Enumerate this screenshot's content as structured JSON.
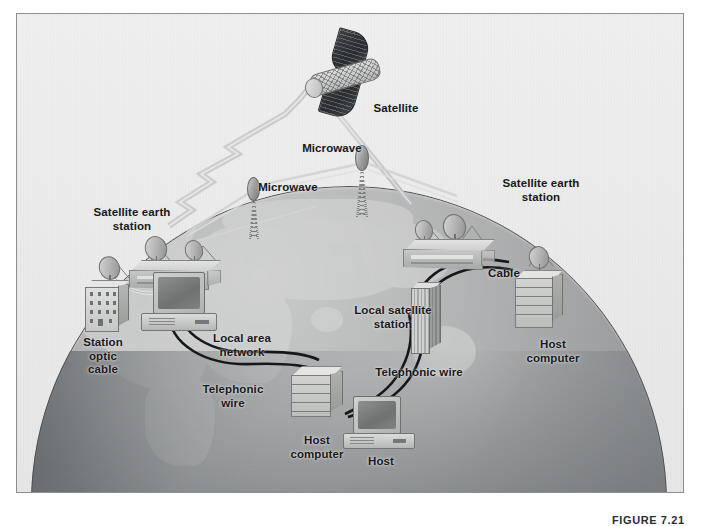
{
  "figure": {
    "caption": "FIGURE 7.21",
    "border_color": "#8d8d8d",
    "sky_color": "#ececed",
    "globe_land_color": "#c3c5c4",
    "globe_ocean_color": "#a9abac",
    "globe_deep_ocean_color": "#686c6f",
    "label_color": "#17181a"
  },
  "labels": {
    "satellite": "Satellite",
    "microwave_left": "Microwave",
    "microwave_right": "Microwave",
    "satellite_earth_station_left": "Satellite earth\nstation",
    "satellite_earth_station_right": "Satellite earth\nstation",
    "station_optic_cable": "Station\noptic\ncable",
    "local_area_network": "Local area\nnetwork",
    "telephonic_wire_left": "Telephonic\nwire",
    "host_computer_left": "Host\ncomputer",
    "local_satellite_station": "Local satellite\nstation",
    "telephonic_wire_right": "Telephonic wire",
    "host": "Host",
    "cable": "Cable",
    "host_computer_right": "Host\ncomputer"
  },
  "icons": {
    "satellite": "satellite-icon",
    "dish": "satellite-dish-icon",
    "microwave_tower": "microwave-tower-icon",
    "monitor": "crt-computer-icon",
    "server": "server-rack-icon",
    "office": "office-building-icon",
    "skyscraper": "skyscraper-icon",
    "earth_station_building": "earth-station-building-icon",
    "globe": "globe-icon"
  },
  "link_types": [
    "microwave-beam",
    "satellite-uplink",
    "satellite-downlink",
    "fiber-optic-cable",
    "telephonic-wire",
    "coaxial-cable"
  ]
}
